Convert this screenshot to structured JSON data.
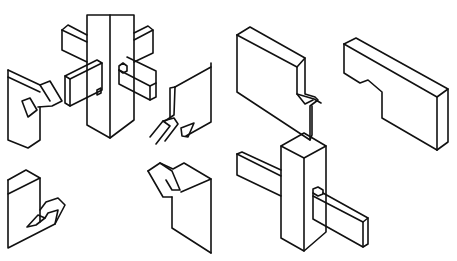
{
  "figure": {
    "stroke_color": "#111111",
    "background_color": "#ffffff"
  },
  "pieces": [
    {
      "name": "central-post-exploded",
      "paths": [
        "M87,15 L134,15 L134,120 L110,138 L87,125 Z",
        "M110,15 L110,138"
      ]
    },
    {
      "name": "arm-upper-left",
      "paths": [
        "M62,30 L68,25 L87,35",
        "M62,30 L62,50 L87,62",
        "M62,30 L87,42"
      ]
    },
    {
      "name": "arm-upper-right",
      "paths": [
        "M134,33 L148,26 L153,30 L153,53 L134,62",
        "M134,40 L153,30"
      ]
    },
    {
      "name": "tenon-front-left",
      "paths": [
        "M65,76 L97,60 L102,63 L102,90 L70,106 L65,103 Z",
        "M65,76 L70,79 L102,63",
        "M70,79 L70,106",
        "M97,90 L101,88 L101,93 L97,95 Z"
      ]
    },
    {
      "name": "tenon-front-right",
      "paths": [
        "M119,66 L123,63 L127,66 L127,71 L123,73 L119,70 Z",
        "M119,70 L119,84 L150,100 L156,97 L156,71 L127,57",
        "M119,70 L150,86 L156,83",
        "M150,86 L150,100"
      ]
    },
    {
      "name": "dovetail-piece-upper-left",
      "paths": [
        "M8,70 L8,140 L28,148 L40,140 L40,107",
        "M8,70 L40,85 L50,81 L62,101 L52,106 L38,107",
        "M8,77 L40,92",
        "M40,85 L50,101",
        "M22,101 L30,98 L37,110 L28,117 Z"
      ]
    },
    {
      "name": "dovetail-piece-upper-right",
      "paths": [
        "M211,63 L211,122 L186,136",
        "M175,87 L211,67",
        "M175,87 L174,115 L165,121",
        "M175,87 L170,88 L170,118",
        "M150,137 L163,121 L174,118 L178,124 L165,141",
        "M163,121 L170,126 L156,144",
        "M181,128 L194,123 L188,137 L182,136 Z"
      ]
    },
    {
      "name": "dovetail-piece-lower-left",
      "paths": [
        "M8,180 L26,170 L40,178 L40,222",
        "M8,180 L8,248 L55,224 L65,205 L58,198 L46,202 L40,210",
        "M8,194 L40,178",
        "M27,227 L38,215 L45,218 L36,225 Z",
        "M45,218 L48,213 L58,210 L55,224"
      ]
    },
    {
      "name": "dovetail-piece-lower-right",
      "paths": [
        "M148,171 L160,163 L173,169 L184,163 L211,179 L211,253",
        "M181,192 L211,179",
        "M172,197 L172,228 L211,253",
        "M148,171 L163,197 L172,197",
        "M160,163 L172,171 L180,190 L172,190 L166,180"
      ]
    },
    {
      "name": "notched-board-left",
      "paths": [
        "M237,35 L250,27 L305,58 L305,94 L315,97 L318,100 L310,106 L310,140",
        "M237,35 L237,92 L310,140 L312,135 L312,106",
        "M237,35 L297,67 L305,58",
        "M297,67 L297,94 L305,104 L313,100",
        "M297,94 L314,99 L321,103"
      ]
    },
    {
      "name": "notched-board-right",
      "paths": [
        "M344,44 L356,38 L448,89 L448,142 L437,150",
        "M344,44 L437,97 L448,89",
        "M437,97 L437,150",
        "M344,44 L344,73 L360,83 L368,80 L382,92 L382,118 L437,150"
      ]
    },
    {
      "name": "assembled-post",
      "paths": [
        "M281,146 L304,133 L326,146 L326,232 L304,251 L281,238 Z",
        "M281,146 L304,158 L326,146",
        "M304,158 L304,251"
      ]
    },
    {
      "name": "assembled-arm-left",
      "paths": [
        "M237,154 L242,152 L281,170",
        "M237,154 L237,175 L281,196",
        "M237,154 L281,176"
      ]
    },
    {
      "name": "assembled-through-tenon",
      "paths": [
        "M313,189 L318,187 L323,190 L323,194 L318,196 L313,193 Z",
        "M313,193 L313,219 L363,247 L368,244 L368,218 L323,193",
        "M313,196 L363,222 L368,218",
        "M363,222 L363,247"
      ]
    }
  ]
}
